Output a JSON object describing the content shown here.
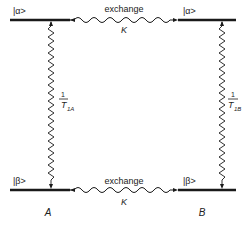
{
  "diagram": {
    "states": {
      "alpha_A": "|α>",
      "alpha_B": "|α>",
      "beta_A": "|β>",
      "beta_B": "|β>"
    },
    "exchange_top": {
      "label": "exchange",
      "rate": "K"
    },
    "exchange_bottom": {
      "label": "exchange",
      "rate": "K"
    },
    "relaxation_A": {
      "numerator": "1",
      "denominator": "T",
      "subscript": "1A"
    },
    "relaxation_B": {
      "numerator": "1",
      "denominator": "T",
      "subscript": "1B"
    },
    "site_A": "A",
    "site_B": "B",
    "colors": {
      "ink": "#1a1a1a",
      "background": "#ffffff"
    }
  }
}
